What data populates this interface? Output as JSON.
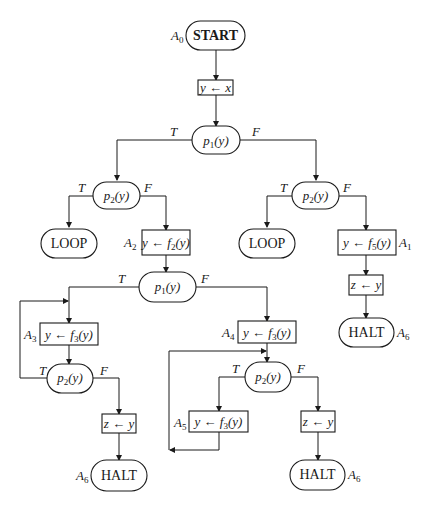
{
  "diagram": {
    "type": "flowchart",
    "nodes": [
      {
        "id": "start",
        "shape": "terminal",
        "text": "START",
        "label": "A0",
        "label_base": "A",
        "label_sub": "0"
      },
      {
        "id": "init",
        "shape": "box",
        "text": "y ← x"
      },
      {
        "id": "p1_top",
        "shape": "decision",
        "text_base": "p",
        "text_sub": "1",
        "text_arg": "(y)"
      },
      {
        "id": "p2_left",
        "shape": "decision",
        "text_base": "p",
        "text_sub": "2",
        "text_arg": "(y)"
      },
      {
        "id": "p2_right",
        "shape": "decision",
        "text_base": "p",
        "text_sub": "2",
        "text_arg": "(y)"
      },
      {
        "id": "loop_left",
        "shape": "terminal",
        "text": "LOOP"
      },
      {
        "id": "a2",
        "shape": "box",
        "text_pre": "y ← f",
        "text_sub": "2",
        "text_arg": "(y)",
        "label_base": "A",
        "label_sub": "2"
      },
      {
        "id": "loop_right",
        "shape": "terminal",
        "text": "LOOP"
      },
      {
        "id": "a1",
        "shape": "box",
        "text_pre": "y ← f",
        "text_sub": "5",
        "text_arg": "(y)",
        "label_base": "A",
        "label_sub": "1"
      },
      {
        "id": "z_right_top",
        "shape": "box",
        "text": "z ← y"
      },
      {
        "id": "halt_top_right",
        "shape": "terminal",
        "text": "HALT",
        "label_base": "A",
        "label_sub": "6"
      },
      {
        "id": "p1_mid",
        "shape": "decision",
        "text_base": "p",
        "text_sub": "1",
        "text_arg": "(y)"
      },
      {
        "id": "a3",
        "shape": "box",
        "text_pre": "y ← f",
        "text_sub": "3",
        "text_arg": "(y)",
        "label_base": "A",
        "label_sub": "3"
      },
      {
        "id": "p2_lower_left",
        "shape": "decision",
        "text_base": "p",
        "text_sub": "2",
        "text_arg": "(y)"
      },
      {
        "id": "z_left",
        "shape": "box",
        "text": "z ← y"
      },
      {
        "id": "halt_left",
        "shape": "terminal",
        "text": "HALT",
        "label_base": "A",
        "label_sub": "6"
      },
      {
        "id": "a4",
        "shape": "box",
        "text_pre": "y ← f",
        "text_sub": "3",
        "text_arg": "(y)",
        "label_base": "A",
        "label_sub": "4"
      },
      {
        "id": "p2_lower_mid",
        "shape": "decision",
        "text_base": "p",
        "text_sub": "2",
        "text_arg": "(y)"
      },
      {
        "id": "a5",
        "shape": "box",
        "text_pre": "y ← f",
        "text_sub": "3",
        "text_arg": "(y)",
        "label_base": "A",
        "label_sub": "5"
      },
      {
        "id": "z_mid",
        "shape": "box",
        "text": "z ← y"
      },
      {
        "id": "halt_mid",
        "shape": "terminal",
        "text": "HALT",
        "label_base": "A",
        "label_sub": "6"
      }
    ],
    "edges": [
      {
        "from": "start",
        "to": "init"
      },
      {
        "from": "init",
        "to": "p1_top"
      },
      {
        "from": "p1_top",
        "to": "p2_left",
        "label": "T"
      },
      {
        "from": "p1_top",
        "to": "p2_right",
        "label": "F"
      },
      {
        "from": "p2_left",
        "to": "loop_left",
        "label": "T"
      },
      {
        "from": "p2_left",
        "to": "a2",
        "label": "F"
      },
      {
        "from": "p2_right",
        "to": "loop_right",
        "label": "T"
      },
      {
        "from": "p2_right",
        "to": "a1",
        "label": "F"
      },
      {
        "from": "a1",
        "to": "z_right_top"
      },
      {
        "from": "z_right_top",
        "to": "halt_top_right"
      },
      {
        "from": "a2",
        "to": "p1_mid"
      },
      {
        "from": "p1_mid",
        "to": "a3",
        "label": "T"
      },
      {
        "from": "p1_mid",
        "to": "a4",
        "label": "F"
      },
      {
        "from": "a3",
        "to": "p2_lower_left"
      },
      {
        "from": "p2_lower_left",
        "to": "a3",
        "label": "T"
      },
      {
        "from": "p2_lower_left",
        "to": "z_left",
        "label": "F"
      },
      {
        "from": "z_left",
        "to": "halt_left"
      },
      {
        "from": "a4",
        "to": "p2_lower_mid"
      },
      {
        "from": "p2_lower_mid",
        "to": "a5",
        "label": "T"
      },
      {
        "from": "p2_lower_mid",
        "to": "z_mid",
        "label": "F"
      },
      {
        "from": "a5",
        "to": "p2_lower_mid"
      },
      {
        "from": "z_mid",
        "to": "halt_mid"
      }
    ],
    "branch_labels": {
      "true": "T",
      "false": "F"
    }
  }
}
